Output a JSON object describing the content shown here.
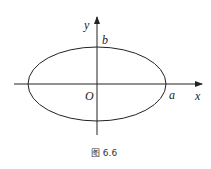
{
  "figure": {
    "caption": "图 6.6",
    "shape": "ellipse",
    "labels": {
      "x_axis": "x",
      "y_axis": "y",
      "origin": "O",
      "semi_major": "a",
      "semi_minor": "b"
    },
    "stroke_color": "#222222",
    "background_color": "#ffffff"
  }
}
